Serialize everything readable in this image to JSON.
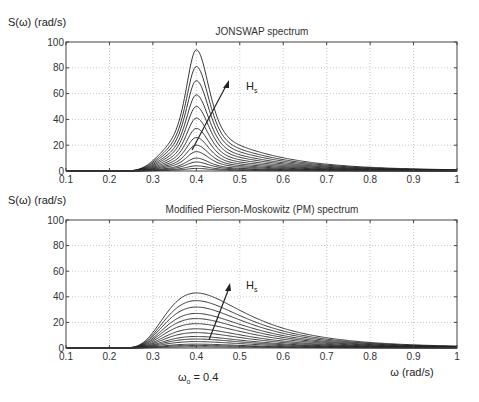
{
  "chart_data": [
    {
      "type": "line",
      "title": "JONSWAP spectrum",
      "ylabel": "S(ω) (rad/s)",
      "xlabel": "",
      "xlim": [
        0.1,
        1
      ],
      "ylim": [
        0,
        100
      ],
      "xticks": [
        "0.1",
        "0.2",
        "0.3",
        "0.4",
        "0.5",
        "0.6",
        "0.7",
        "0.8",
        "0.9",
        "1"
      ],
      "yticks": [
        "0",
        "20",
        "40",
        "60",
        "80",
        "100"
      ],
      "grid": true,
      "peak_frequency": 0.4,
      "spectrum_model": "jonswap",
      "series_peaks": [
        94,
        81,
        70,
        59,
        50,
        41,
        33,
        26,
        20,
        15,
        10,
        7,
        4,
        2
      ],
      "annotation": {
        "text": "H",
        "subscript": "s",
        "meaning": "increasing significant wave height"
      }
    },
    {
      "type": "line",
      "title": "Modified Pierson-Moskowitz (PM) spectrum",
      "ylabel": "S(ω) (rad/s)",
      "xlabel": "ω (rad/s)",
      "xlim": [
        0.1,
        1
      ],
      "ylim": [
        0,
        100
      ],
      "xticks": [
        "0.1",
        "0.2",
        "0.3",
        "0.4",
        "0.5",
        "0.6",
        "0.7",
        "0.8",
        "0.9",
        "1"
      ],
      "yticks": [
        "0",
        "20",
        "40",
        "60",
        "80",
        "100"
      ],
      "grid": true,
      "peak_frequency": 0.4,
      "spectrum_model": "pm",
      "series_peaks": [
        43,
        37,
        32,
        27,
        23,
        19,
        15,
        12,
        9,
        7,
        5,
        3,
        2,
        1
      ],
      "annotation": {
        "text": "H",
        "subscript": "s",
        "meaning": "increasing significant wave height"
      }
    }
  ],
  "labels": {
    "top_ylabel": "S(ω) (rad/s)",
    "top_title": "JONSWAP spectrum",
    "bottom_ylabel": "S(ω) (rad/s)",
    "bottom_title": "Modified Pierson-Moskowitz (PM) spectrum",
    "xlabel": "ω (rad/s)",
    "omega0_symbol": "ω",
    "omega0_sub": "o",
    "omega0_value": " = 0.4",
    "hs_main": "H",
    "hs_sub": "s"
  },
  "colors": {
    "curve": "#222222",
    "axis": "#444444",
    "grid": "#bbbbbb",
    "text": "#333333"
  }
}
